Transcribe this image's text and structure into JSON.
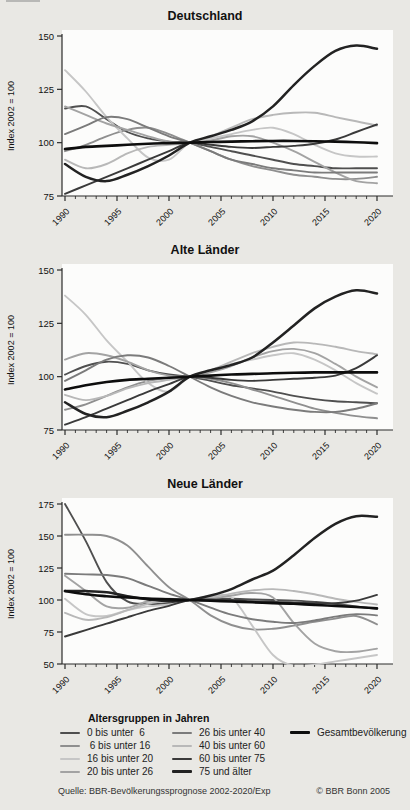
{
  "page": {
    "background": "#e9e8e4",
    "plot_background": "#fcfcfb",
    "axis_color": "#2b2b2b"
  },
  "axes": {
    "ylabel": "Index 2002 = 100",
    "x_major_ticks": [
      1990,
      1995,
      2000,
      2005,
      2010,
      2015,
      2020
    ],
    "x_minor_step": 1,
    "xlim": [
      1990,
      2020
    ]
  },
  "series_styles": {
    "0 bis unter 6": {
      "color": "#4f4f4f",
      "width": 1.9
    },
    "6 bis unter 16": {
      "color": "#8f8f8f",
      "width": 1.9
    },
    "16 bis unter 20": {
      "color": "#c6c6c6",
      "width": 1.9
    },
    "20 bis unter 26": {
      "color": "#a3a3a3",
      "width": 1.9
    },
    "26 bis unter 40": {
      "color": "#7b7b7b",
      "width": 1.9
    },
    "40 bis unter 60": {
      "color": "#b8b8b8",
      "width": 1.9
    },
    "60 bis unter 75": {
      "color": "#3a3a3a",
      "width": 1.9
    },
    "75 und älter": {
      "color": "#222222",
      "width": 2.5
    },
    "Gesamtbevölkerung": {
      "color": "#0d0d0d",
      "width": 2.6
    }
  },
  "chart_data": [
    {
      "type": "line",
      "title": "Deutschland",
      "ylabel": "Index 2002 = 100",
      "ylim": [
        75,
        150
      ],
      "yticks": [
        75,
        100,
        125,
        150
      ],
      "x": [
        1990,
        1992,
        1994,
        1996,
        1998,
        2000,
        2002,
        2004,
        2006,
        2008,
        2010,
        2012,
        2014,
        2016,
        2018,
        2020
      ],
      "series": [
        {
          "name": "0 bis unter 6",
          "values": [
            116,
            117,
            111,
            105,
            102,
            100.5,
            100,
            98,
            96,
            94,
            92,
            90,
            89,
            88,
            88,
            88
          ]
        },
        {
          "name": "6 bis unter 16",
          "values": [
            96,
            99,
            103,
            106,
            107,
            104,
            100,
            96,
            92,
            89,
            87,
            85,
            84,
            83,
            83,
            84
          ]
        },
        {
          "name": "16 bis unter 20",
          "values": [
            134,
            124,
            112,
            102,
            93,
            92,
            100,
            102,
            104,
            106,
            107,
            104,
            99,
            95,
            93.5,
            93.5
          ]
        },
        {
          "name": "20 bis unter 26",
          "values": [
            117,
            113,
            109,
            106,
            103,
            100.5,
            100,
            101,
            103,
            103,
            100,
            96,
            91,
            86,
            82,
            81
          ]
        },
        {
          "name": "26 bis unter 40",
          "values": [
            104,
            108,
            112,
            111,
            107,
            103,
            100,
            96,
            92,
            90,
            88,
            87,
            86,
            86,
            86,
            86
          ]
        },
        {
          "name": "40 bis unter 60",
          "values": [
            92,
            88,
            90,
            95,
            98,
            99,
            100,
            103,
            107,
            111,
            113,
            114,
            114,
            112,
            110,
            108
          ]
        },
        {
          "name": "60 bis unter 75",
          "values": [
            76,
            80,
            84,
            88,
            92,
            96,
            100,
            99,
            98,
            97.5,
            98,
            98.5,
            99.5,
            101.5,
            105,
            108.5
          ]
        },
        {
          "name": "75 und älter",
          "values": [
            90,
            84,
            82,
            85,
            89,
            94,
            100,
            103,
            106,
            110,
            117,
            127,
            136,
            143,
            145.5,
            144
          ]
        },
        {
          "name": "Gesamtbevölkerung",
          "values": [
            97,
            98,
            98.5,
            99,
            99.5,
            99.8,
            100,
            100.3,
            100.5,
            100.7,
            100.8,
            100.8,
            100.7,
            100.5,
            100.2,
            99.8
          ]
        }
      ]
    },
    {
      "type": "line",
      "title": "Alte Länder",
      "ylabel": "Index 2002 = 100",
      "ylim": [
        75,
        150
      ],
      "yticks": [
        75,
        100,
        125,
        150
      ],
      "x": [
        1990,
        1992,
        1994,
        1996,
        1998,
        2000,
        2002,
        2004,
        2006,
        2008,
        2010,
        2012,
        2014,
        2016,
        2018,
        2020
      ],
      "series": [
        {
          "name": "0 bis unter 6",
          "values": [
            101,
            105,
            107,
            106,
            103,
            101,
            100,
            98,
            96,
            94.5,
            93,
            91,
            89.5,
            88.5,
            88,
            87.5
          ]
        },
        {
          "name": "6 bis unter 16",
          "values": [
            84.5,
            87,
            91,
            95,
            98,
            99.5,
            100,
            99,
            97,
            94,
            91,
            88,
            85,
            83,
            81.5,
            80.5
          ]
        },
        {
          "name": "16 bis unter 20",
          "values": [
            138,
            129,
            117,
            107,
            97,
            93,
            100,
            103,
            106,
            108,
            110,
            111,
            108,
            103,
            97,
            92
          ]
        },
        {
          "name": "20 bis unter 26",
          "values": [
            108,
            111,
            110,
            107,
            103,
            100.5,
            100,
            102,
            105,
            109,
            112,
            113,
            111,
            106,
            100,
            95
          ]
        },
        {
          "name": "26 bis unter 40",
          "values": [
            98,
            103,
            108,
            110,
            109,
            105,
            100,
            95,
            91,
            88,
            86,
            84.5,
            83.5,
            83.5,
            85,
            87.5
          ]
        },
        {
          "name": "40 bis unter 60",
          "values": [
            91.5,
            89,
            91,
            94.5,
            97,
            98.5,
            100,
            103,
            107,
            111,
            114,
            116,
            115.5,
            114,
            112,
            110.5
          ]
        },
        {
          "name": "60 bis unter 75",
          "values": [
            77.5,
            81,
            85,
            89,
            93,
            96.5,
            100,
            99.5,
            98.5,
            98,
            98.5,
            99,
            99.5,
            100.5,
            104,
            110
          ]
        },
        {
          "name": "75 und älter",
          "values": [
            88,
            82.5,
            81,
            84,
            88,
            93,
            100,
            103,
            105.5,
            109,
            116,
            124,
            132,
            137.5,
            140.5,
            139
          ]
        },
        {
          "name": "Gesamtbevölkerung",
          "values": [
            94,
            96,
            97.5,
            98.5,
            99,
            99.5,
            100,
            100.5,
            101,
            101.3,
            101.6,
            101.8,
            102,
            102,
            102,
            102
          ]
        }
      ]
    },
    {
      "type": "line",
      "title": "Neue Länder",
      "ylabel": "Index 2002 = 100",
      "ylim": [
        50,
        175
      ],
      "yticks": [
        50,
        75,
        100,
        125,
        150,
        175
      ],
      "x": [
        1990,
        1992,
        1994,
        1996,
        1998,
        2000,
        2002,
        2004,
        2006,
        2008,
        2010,
        2012,
        2014,
        2016,
        2018,
        2020
      ],
      "series": [
        {
          "name": "0 bis unter 6",
          "values": [
            175,
            146,
            114,
            99,
            97,
            97.5,
            100,
            101,
            101,
            100.5,
            100,
            99.5,
            98.5,
            97,
            95,
            93
          ]
        },
        {
          "name": "6 bis unter 16",
          "values": [
            151,
            151,
            150,
            142.5,
            126,
            110,
            100,
            88,
            80.5,
            77,
            77.5,
            80,
            83,
            85.5,
            87.5,
            81
          ]
        },
        {
          "name": "16 bis unter 20",
          "values": [
            101,
            89,
            87.5,
            92,
            95,
            96.5,
            100,
            103,
            102,
            80,
            57,
            48.5,
            49.5,
            52,
            54.5,
            57
          ]
        },
        {
          "name": "20 bis unter 26",
          "values": [
            119,
            107,
            95,
            94,
            99,
            101,
            100,
            101,
            103.5,
            105.5,
            102,
            82,
            66,
            60,
            59.5,
            62
          ]
        },
        {
          "name": "26 bis unter 40",
          "values": [
            120.5,
            120,
            119.5,
            117,
            111,
            105,
            100,
            94,
            88.5,
            85,
            83,
            82,
            84,
            87,
            89,
            88
          ]
        },
        {
          "name": "40 bis unter 60",
          "values": [
            90,
            84.5,
            86.5,
            92,
            97,
            99.5,
            100,
            102,
            105,
            107.5,
            108.5,
            107,
            104.5,
            101,
            98.5,
            96.5
          ]
        },
        {
          "name": "60 bis unter 75",
          "values": [
            71.5,
            76.5,
            81.5,
            86.5,
            91.5,
            95.5,
            100,
            100.5,
            100,
            99,
            98.5,
            98,
            97.5,
            97.5,
            99.5,
            104
          ]
        },
        {
          "name": "75 und älter",
          "values": [
            107,
            107,
            106,
            103,
            100.5,
            99,
            100,
            103.5,
            108.5,
            116,
            123,
            135,
            148.5,
            159.5,
            165.5,
            165
          ]
        },
        {
          "name": "Gesamtbevölkerung",
          "values": [
            107,
            104.5,
            103,
            102,
            101.2,
            100.6,
            100,
            99.4,
            98.8,
            98.2,
            97.6,
            97,
            96.2,
            95.4,
            94.5,
            93.5
          ]
        }
      ]
    }
  ],
  "legend": {
    "title": "Altersgruppen in Jahren",
    "columns": [
      [
        {
          "group": "0 bis unter 6",
          "label": "0 bis unter  6"
        },
        {
          "group": "6 bis unter 16",
          "label": " 6 bis unter 16"
        },
        {
          "group": "16 bis unter 20",
          "label": "16 bis unter 20"
        },
        {
          "group": "20 bis unter 26",
          "label": "20 bis unter 26"
        }
      ],
      [
        {
          "group": "26 bis unter 40",
          "label": "26 bis unter 40"
        },
        {
          "group": "40 bis unter 60",
          "label": "40 bis unter 60"
        },
        {
          "group": "60 bis unter 75",
          "label": "60 bis unter 75"
        },
        {
          "group": "75 und älter",
          "label": "75 und älter"
        }
      ],
      [
        {
          "group": "Gesamtbevölkerung",
          "label": "Gesamtbevölkerung"
        }
      ]
    ]
  },
  "footer": {
    "source": "Quelle: BBR-Bevölkerungssprognose 2002-2020/Exp",
    "copyright": "© BBR Bonn 2005"
  }
}
